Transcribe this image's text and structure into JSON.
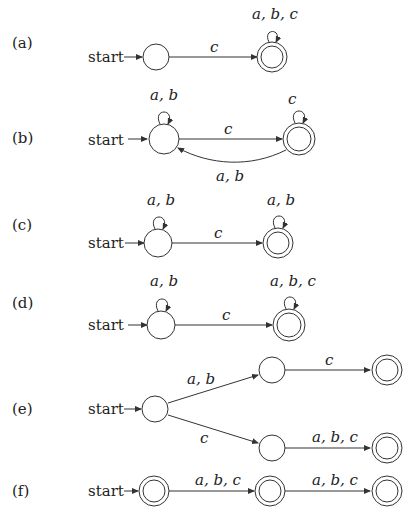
{
  "start_label": "start",
  "diagrams": [
    {
      "label": "(a)",
      "edges": {
        "s0_s1": "c",
        "s1_loop": "a, b, c"
      }
    },
    {
      "label": "(b)",
      "edges": {
        "s0_loop": "a, b",
        "s0_s1": "c",
        "s1_loop": "c",
        "s1_s0": "a, b"
      }
    },
    {
      "label": "(c)",
      "edges": {
        "s0_loop": "a, b",
        "s0_s1": "c",
        "s1_loop": "a, b"
      }
    },
    {
      "label": "(d)",
      "edges": {
        "s0_loop": "a, b",
        "s0_s1": "c",
        "s1_loop": "a, b, c"
      }
    },
    {
      "label": "(e)",
      "edges": {
        "s0_s1": "a, b",
        "s0_s2": "c",
        "s1_s3": "c",
        "s2_s4": "a, b, c"
      }
    },
    {
      "label": "(f)",
      "edges": {
        "s0_s1": "a, b, c",
        "s1_s2": "a, b, c"
      }
    }
  ]
}
